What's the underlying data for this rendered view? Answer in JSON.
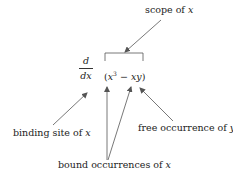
{
  "diagram": {
    "labels": {
      "scope": {
        "text": "scope of ",
        "var": "x"
      },
      "binding_site": {
        "text": "binding site of ",
        "var": "x"
      },
      "free_occurrence": {
        "text": "free occurrence of ",
        "var": "y"
      },
      "bound_occurrences": {
        "text": "bound occurrences of ",
        "var": "x"
      }
    },
    "operator": {
      "numerator": "d",
      "denominator": "dx"
    },
    "expression": {
      "open": "(",
      "base": "x",
      "exponent": "3",
      "minus": " − ",
      "term": "xy",
      "close": ")"
    },
    "colors": {
      "text": "#222222",
      "arrow": "#555555"
    }
  }
}
